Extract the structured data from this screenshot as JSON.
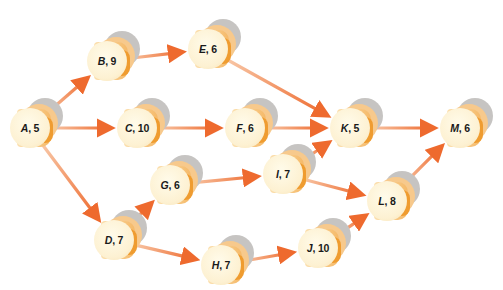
{
  "diagram": {
    "type": "activity-on-node network",
    "colors": {
      "arrow": "#ee6a2e",
      "arrow_tail": "#f8c8a8",
      "node_face": "#fdf1d2",
      "node_body": "#f7c98c",
      "node_shadow": "#c6c4c2",
      "background": "#ffffff"
    },
    "nodes": [
      {
        "id": "A",
        "letter": "A",
        "duration": "5",
        "x": 30,
        "y": 128
      },
      {
        "id": "B",
        "letter": "B",
        "duration": "9",
        "x": 107,
        "y": 61
      },
      {
        "id": "C",
        "letter": "C",
        "duration": "10",
        "x": 137,
        "y": 128
      },
      {
        "id": "D",
        "letter": "D",
        "duration": "7",
        "x": 114,
        "y": 240
      },
      {
        "id": "E",
        "letter": "E",
        "duration": "6",
        "x": 208,
        "y": 49
      },
      {
        "id": "F",
        "letter": "F",
        "duration": "6",
        "x": 245,
        "y": 128
      },
      {
        "id": "G",
        "letter": "G",
        "duration": "6",
        "x": 170,
        "y": 185
      },
      {
        "id": "H",
        "letter": "H",
        "duration": "7",
        "x": 221,
        "y": 265
      },
      {
        "id": "I",
        "letter": "I",
        "duration": "7",
        "x": 283,
        "y": 174
      },
      {
        "id": "J",
        "letter": "J",
        "duration": "10",
        "x": 318,
        "y": 248
      },
      {
        "id": "K",
        "letter": "K",
        "duration": "5",
        "x": 350,
        "y": 128
      },
      {
        "id": "L",
        "letter": "L",
        "duration": "8",
        "x": 387,
        "y": 201
      },
      {
        "id": "M",
        "letter": "M",
        "duration": "6",
        "x": 460,
        "y": 128
      }
    ],
    "edges": [
      {
        "from": "A",
        "to": "B"
      },
      {
        "from": "A",
        "to": "C"
      },
      {
        "from": "A",
        "to": "D"
      },
      {
        "from": "B",
        "to": "E"
      },
      {
        "from": "C",
        "to": "F"
      },
      {
        "from": "D",
        "to": "G"
      },
      {
        "from": "D",
        "to": "H"
      },
      {
        "from": "E",
        "to": "K"
      },
      {
        "from": "F",
        "to": "K"
      },
      {
        "from": "G",
        "to": "I"
      },
      {
        "from": "H",
        "to": "J"
      },
      {
        "from": "I",
        "to": "K"
      },
      {
        "from": "I",
        "to": "L"
      },
      {
        "from": "J",
        "to": "L"
      },
      {
        "from": "K",
        "to": "M"
      },
      {
        "from": "L",
        "to": "M"
      }
    ]
  }
}
